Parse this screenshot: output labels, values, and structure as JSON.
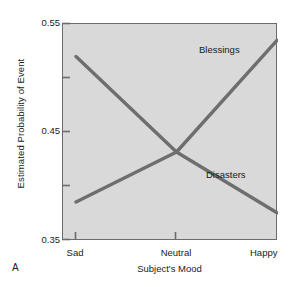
{
  "panel": {
    "label": "A"
  },
  "chart_data": {
    "type": "line",
    "title": "",
    "xlabel": "Subject's Mood",
    "ylabel": "Estimated Probability of Event",
    "categories": [
      "Sad",
      "Neutral",
      "Happy"
    ],
    "x": [
      0,
      1,
      2
    ],
    "xlim": [
      0,
      2
    ],
    "ylim": [
      0.35,
      0.55
    ],
    "yticks": [
      0.35,
      0.45,
      0.55
    ],
    "ytick_labels": [
      "0.35",
      "0.45",
      "0.55"
    ],
    "yticks_minor": [
      0.4,
      0.5
    ],
    "grid": false,
    "legend_position": "inline-annotations",
    "plot_background": "#d9d9d9",
    "axis_color": "#6b6b6b",
    "series": [
      {
        "name": "Disasters",
        "values": [
          0.52,
          0.432,
          0.376
        ],
        "color": "#6e6e6e",
        "label_x": 2,
        "label_text": "Disasters"
      },
      {
        "name": "Blessings",
        "values": [
          0.386,
          0.432,
          0.535
        ],
        "color": "#6e6e6e",
        "label_x": 2,
        "label_text": "Blessings"
      }
    ],
    "annotations": [
      {
        "text": "Blessings",
        "series": "Blessings"
      },
      {
        "text": "Disasters",
        "series": "Disasters"
      }
    ]
  }
}
